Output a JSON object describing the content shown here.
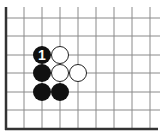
{
  "diagram": {
    "type": "go-board-fragment",
    "edges_shown": [
      "left",
      "bottom"
    ],
    "grid": {
      "columns_x": [
        6,
        24,
        42,
        60,
        78,
        96,
        114,
        132,
        150
      ],
      "rows_y": [
        18,
        36,
        55,
        73,
        92,
        110,
        129
      ],
      "line_top": 7,
      "line_right": 160,
      "line_color": "#8a8a8a",
      "edge_color": "#333333"
    },
    "stones": [
      {
        "color": "black",
        "col": 2,
        "row": 2,
        "label": "1"
      },
      {
        "color": "white",
        "col": 3,
        "row": 2,
        "label": ""
      },
      {
        "color": "black",
        "col": 2,
        "row": 3,
        "label": ""
      },
      {
        "color": "white",
        "col": 3,
        "row": 3,
        "label": ""
      },
      {
        "color": "white",
        "col": 4,
        "row": 3,
        "label": ""
      },
      {
        "color": "black",
        "col": 2,
        "row": 4,
        "label": ""
      },
      {
        "color": "black",
        "col": 3,
        "row": 4,
        "label": ""
      }
    ],
    "stone_radius": 9,
    "colors": {
      "black_stone": "#111111",
      "white_stone": "#ffffff",
      "white_stroke": "#222222",
      "label_on_black": "#ffffff"
    }
  }
}
